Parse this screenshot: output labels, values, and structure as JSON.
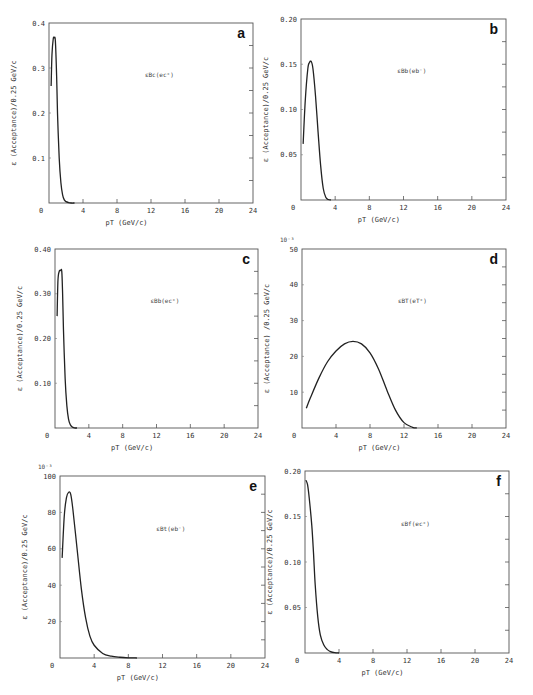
{
  "figure": {
    "panel_count": 6
  },
  "chart_data": [
    {
      "id": "a",
      "type": "line",
      "panel_letter": "a",
      "annotation": "ε_Bc(e_c⁺)",
      "annotation_display": "εBc(ec⁺)",
      "xlabel": "pT (GeV/c)",
      "ylabel": "ε (Acceptance)/0.25 GeV/c",
      "y_multiplier": "",
      "xlim": [
        0,
        24
      ],
      "ylim": [
        0,
        0.4
      ],
      "xticks": [
        0,
        4,
        8,
        12,
        16,
        20,
        24
      ],
      "yticks": [
        0.1,
        0.2,
        0.3,
        0.4
      ],
      "ytick_labels": [
        "0.1",
        "0.2",
        "0.3",
        "0.4"
      ],
      "x0_label": "0",
      "x": [
        0.25,
        0.35,
        0.5,
        0.6,
        0.75,
        0.9,
        1.0,
        1.2,
        1.4,
        1.6,
        1.8,
        2.0,
        2.3,
        2.6,
        3.0
      ],
      "y": [
        0.26,
        0.33,
        0.365,
        0.367,
        0.36,
        0.28,
        0.2,
        0.1,
        0.045,
        0.018,
        0.007,
        0.003,
        0.001,
        0.0,
        0.0
      ],
      "box": {
        "left": 49,
        "top": 23,
        "right": 253,
        "bottom": 203
      }
    },
    {
      "id": "b",
      "type": "line",
      "panel_letter": "b",
      "annotation": "ε_Bb(e_b⁻)",
      "annotation_display": "εBb(eb⁻)",
      "xlabel": "pT (GeV/c)",
      "ylabel": "ε (Acceptance)/0.25 GeV/c",
      "y_multiplier": "",
      "xlim": [
        0,
        24
      ],
      "ylim": [
        0,
        0.2
      ],
      "xticks": [
        0,
        4,
        8,
        12,
        16,
        20,
        24
      ],
      "yticks": [
        0.05,
        0.1,
        0.15,
        0.2
      ],
      "ytick_labels": [
        "0.05",
        "0.10",
        "0.15",
        "0.20"
      ],
      "x0_label": "0",
      "x": [
        0.25,
        0.5,
        0.8,
        1.0,
        1.2,
        1.4,
        1.7,
        2.0,
        2.3,
        2.6,
        2.9,
        3.2,
        3.5
      ],
      "y": [
        0.062,
        0.11,
        0.145,
        0.152,
        0.153,
        0.145,
        0.115,
        0.075,
        0.038,
        0.013,
        0.003,
        0.0005,
        0.0
      ],
      "box": {
        "left": 301,
        "top": 19,
        "right": 506,
        "bottom": 200
      }
    },
    {
      "id": "c",
      "type": "line",
      "panel_letter": "c",
      "annotation": "ε_Bb(e_c⁺)",
      "annotation_display": "εBb(ec⁺)",
      "xlabel": "pT (GeV/c)",
      "ylabel": "ε (Acceptance)/0.25 GeV/c",
      "y_multiplier": "",
      "xlim": [
        0,
        24
      ],
      "ylim": [
        0,
        0.4
      ],
      "xticks": [
        0,
        4,
        8,
        12,
        16,
        20,
        24
      ],
      "yticks": [
        0.1,
        0.2,
        0.3,
        0.4
      ],
      "ytick_labels": [
        "0.10",
        "0.20",
        "0.30",
        "0.40"
      ],
      "x0_label": "0",
      "x": [
        0.25,
        0.35,
        0.5,
        0.65,
        0.8,
        0.9,
        1.0,
        1.2,
        1.4,
        1.6,
        1.8,
        2.0,
        2.3,
        2.6
      ],
      "y": [
        0.25,
        0.33,
        0.35,
        0.352,
        0.35,
        0.3,
        0.22,
        0.11,
        0.05,
        0.02,
        0.008,
        0.003,
        0.0005,
        0.0
      ],
      "box": {
        "left": 55,
        "top": 249,
        "right": 258,
        "bottom": 428
      }
    },
    {
      "id": "d",
      "type": "line",
      "panel_letter": "d",
      "annotation": "ε_BT(e_T⁺)",
      "annotation_display": "εBT(eT⁺)",
      "xlabel": "pT (GeV/c)",
      "ylabel": "ε (Acceptance) /0.25 GeV/c",
      "y_multiplier": "10⁻³",
      "xlim": [
        0,
        24
      ],
      "ylim": [
        0,
        50
      ],
      "xticks": [
        0,
        4,
        8,
        12,
        16,
        20,
        24
      ],
      "yticks": [
        10,
        20,
        30,
        40,
        50
      ],
      "ytick_labels": [
        "10",
        "20",
        "30",
        "40",
        "50"
      ],
      "x0_label": "0",
      "x": [
        0.5,
        1,
        2,
        3,
        4,
        5,
        6,
        7,
        8,
        9,
        10,
        11,
        12,
        13,
        13.5
      ],
      "y": [
        5.5,
        8.5,
        14,
        18.5,
        21.5,
        23.5,
        24.2,
        23.5,
        21,
        16.5,
        10.5,
        5,
        1.5,
        0.2,
        0.0
      ],
      "box": {
        "left": 302,
        "top": 249,
        "right": 506,
        "bottom": 428
      }
    },
    {
      "id": "e",
      "type": "line",
      "panel_letter": "e",
      "annotation": "ε_Bt(e_b⁻)",
      "annotation_display": "εBt(eb⁻)",
      "xlabel": "pT (GeV/c)",
      "ylabel": "ε (Acceptance)/0.25 GeV/c",
      "y_multiplier": "10⁻³",
      "xlim": [
        0,
        24
      ],
      "ylim": [
        0,
        100
      ],
      "xticks": [
        0,
        4,
        8,
        12,
        16,
        20,
        24
      ],
      "yticks": [
        20,
        40,
        60,
        80,
        100
      ],
      "ytick_labels": [
        "20",
        "40",
        "60",
        "80",
        "100"
      ],
      "x0_label": "0",
      "x": [
        0.25,
        0.5,
        0.75,
        1.0,
        1.25,
        1.5,
        2.0,
        2.5,
        3.0,
        3.5,
        4.0,
        5.0,
        6.0,
        7.0,
        8.0,
        9.0
      ],
      "y": [
        55,
        78,
        88,
        91,
        90,
        82,
        60,
        38,
        22,
        12,
        7,
        2.5,
        1,
        0.4,
        0.1,
        0.0
      ],
      "box": {
        "left": 60,
        "top": 476,
        "right": 265,
        "bottom": 658
      }
    },
    {
      "id": "f",
      "type": "line",
      "panel_letter": "f",
      "annotation": "ε_Bf(e_c⁺)",
      "annotation_display": "εBf(ec⁺)",
      "xlabel": "pT (GeV/c)",
      "ylabel": "ε (Acceptance)/0.25 GeV/c",
      "y_multiplier": "",
      "xlim": [
        0,
        24
      ],
      "ylim": [
        0,
        0.2
      ],
      "xticks": [
        0,
        4,
        8,
        12,
        16,
        20,
        24
      ],
      "yticks": [
        0.05,
        0.1,
        0.15,
        0.2
      ],
      "ytick_labels": [
        "0.05",
        "0.10",
        "0.15",
        "0.20"
      ],
      "x0_label": "0",
      "x": [
        0.1,
        0.3,
        0.5,
        0.8,
        1.0,
        1.2,
        1.5,
        1.8,
        2.2,
        2.6,
        3.0,
        3.5,
        4.0
      ],
      "y": [
        0.19,
        0.185,
        0.17,
        0.14,
        0.11,
        0.075,
        0.04,
        0.02,
        0.009,
        0.004,
        0.0015,
        0.0003,
        0.0
      ],
      "box": {
        "left": 305,
        "top": 471,
        "right": 509,
        "bottom": 653
      }
    }
  ]
}
